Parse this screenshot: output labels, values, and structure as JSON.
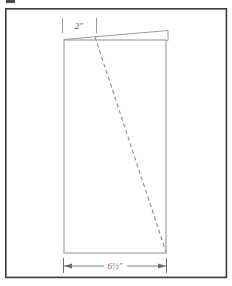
{
  "figure": {
    "background_color": "#ffffff",
    "frame": {
      "name": "outer-border-frame",
      "color": "#3a3a3a",
      "x": 5,
      "y": 8,
      "width": 222,
      "height": 270,
      "stroke_width": 1.6
    },
    "corner_mark": {
      "name": "page-edge-mark",
      "color": "#4a4a4a"
    },
    "panel": {
      "name": "main-panel-rectangle",
      "color": "#9a9a9a",
      "stroke_width": 1.1,
      "left": 64,
      "top": 40,
      "right": 166,
      "bottom": 253
    },
    "wedge": {
      "name": "tapered-top-flap",
      "color": "#9a9a9a",
      "stroke_width": 1.0,
      "description": "thin tapered sliver above panel top edge rising to the right",
      "points": "64,38 168,30 168,40 64,40"
    },
    "cut_line": {
      "name": "diagonal-cut-line",
      "color": "#8c8c8c",
      "stroke_width": 1.1,
      "dash": "4 3",
      "x1": 95,
      "y1": 37,
      "x2": 166,
      "y2": 252
    },
    "dimensions": [
      {
        "id": "top-width",
        "name": "dimension-top-width",
        "label": "2\"",
        "value": "2",
        "unit": "inch",
        "orientation": "horizontal",
        "position": "top",
        "color": "#8c8c8c",
        "tick_left_x": 62,
        "tick_right_x": 96,
        "tick_top_y": 18,
        "tick_bottom_y": 33,
        "label_x": 79,
        "label_y": 29
      },
      {
        "id": "bottom-width",
        "name": "dimension-bottom-width",
        "label": "6½\"",
        "value": "6.5",
        "unit": "inch",
        "orientation": "horizontal",
        "position": "bottom",
        "color": "#6f6f6f",
        "arrow_left_x": 64,
        "arrow_right_x": 166,
        "line_y": 266,
        "ext_top_y": 258,
        "ext_bottom_y": 273,
        "label_x": 115,
        "label_y": 269
      }
    ]
  }
}
